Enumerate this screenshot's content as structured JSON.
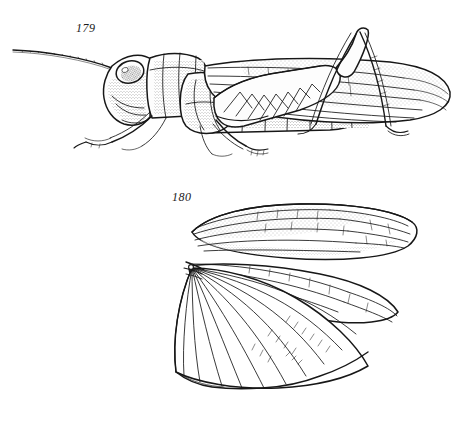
{
  "plate": {
    "background_color": "#ffffff",
    "ink_color": "#171717",
    "medium": "pen-and-ink line drawing with stipple shading",
    "width": 470,
    "height": 427
  },
  "figures": [
    {
      "label": "179",
      "caption_text": "179",
      "subject": "grasshopper-lateral-habitus",
      "orientation": "left-facing lateral view",
      "parts": [
        "antenna",
        "compound-eye",
        "head",
        "pronotum",
        "thorax",
        "tegmen",
        "hind-femur",
        "hind-tibia",
        "hind-tarsus",
        "fore-leg",
        "mid-leg",
        "abdomen-segments",
        "wing-apex"
      ]
    },
    {
      "label": "180",
      "caption_text": "180",
      "subject": "grasshopper-wings-spread",
      "orientation": "tegmen above, folded-fan hindwing below",
      "parts": [
        "tegmen",
        "costal-margin-stipple",
        "longitudinal-veins",
        "hindwing-anal-fan",
        "fan-pivot",
        "cross-veins",
        "scalloped-posterior-margin"
      ]
    }
  ]
}
